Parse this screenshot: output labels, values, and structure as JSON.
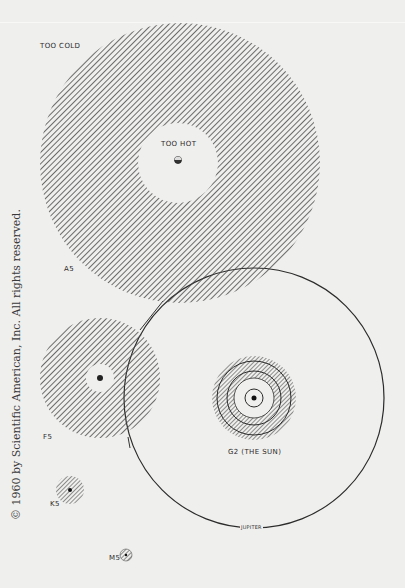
{
  "labels": {
    "too_cold": "TOO COLD",
    "too_hot": "TOO HOT",
    "a5": "A5",
    "f5": "F5",
    "g2": "G2   (THE SUN)",
    "k5": "K5",
    "m5": "M5",
    "jupiter": "JUPITER",
    "mars": "MARS",
    "earth": "EARTH",
    "venus": "VENUS"
  },
  "copyright": "© 1960 by Scientific American, Inc. All rights reserved.",
  "colors": {
    "background": "#efefed",
    "hatch": "#444444",
    "orbit": "#2b2b2b"
  },
  "stars": [
    {
      "type": "A5",
      "cx": 180,
      "cy": 163,
      "habitable_outer_r": 140,
      "habitable_inner_r": 40
    },
    {
      "type": "F5",
      "cx": 100,
      "cy": 378,
      "habitable_outer_r": 60,
      "habitable_inner_r": 14
    },
    {
      "type": "G2",
      "cx": 254,
      "cy": 398,
      "habitable_outer_r": 42,
      "habitable_inner_r": 20,
      "jupiter_orbit_r": 130
    },
    {
      "type": "K5",
      "cx": 70,
      "cy": 490,
      "habitable_outer_r": 14,
      "habitable_inner_r": 0
    },
    {
      "type": "M5",
      "cx": 126,
      "cy": 555,
      "habitable_outer_r": 6,
      "habitable_inner_r": 0
    }
  ]
}
